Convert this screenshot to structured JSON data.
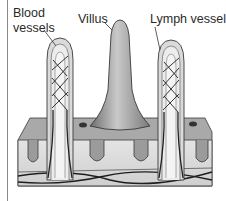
{
  "diagram": {
    "labels": {
      "blood_vessels_line1": "Blood",
      "blood_vessels_line2": "vessels",
      "villus": "Villus",
      "lymph_vessel": "Lymph vessel"
    },
    "colors": {
      "outline": "#3a3a3a",
      "tissue_light": "#dcdcdc",
      "tissue_mid": "#b5b5b5",
      "villus_fill": "#9a9a9a",
      "vessel_dark": "#1e1e1e",
      "frame_line": "#8a8a8a"
    }
  }
}
